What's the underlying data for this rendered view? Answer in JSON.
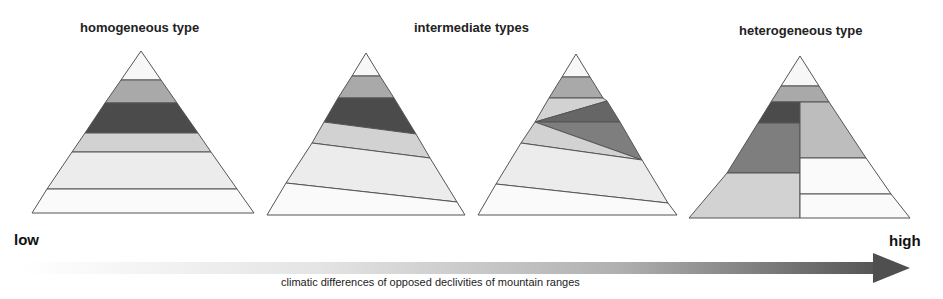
{
  "titles": {
    "homogeneous": "homogeneous type",
    "intermediate": "intermediate types",
    "heterogeneous": "heterogeneous type"
  },
  "axis": {
    "low_label": "low",
    "high_label": "high",
    "caption": "climatic differences of opposed declivities of mountain ranges"
  },
  "colors": {
    "white": "#f7f7f7",
    "very_light": "#ececec",
    "light_gray": "#d2d2d2",
    "mid_gray": "#a9a9a9",
    "mid_dark": "#7e7e7e",
    "dark": "#4b4b4b",
    "outline": "#555555"
  },
  "diagrams": [
    {
      "name": "homogeneous",
      "bands": [
        "white",
        "mid_gray",
        "dark",
        "light_gray",
        "very_light",
        "white"
      ]
    },
    {
      "name": "intermediate-1",
      "bands": [
        "white",
        "mid_gray",
        "dark",
        "light_gray",
        "very_light",
        "white"
      ]
    },
    {
      "name": "intermediate-2",
      "bands": [
        "white",
        "mid_gray",
        "light_gray",
        "dark",
        "mid_dark",
        "light_gray",
        "very_light",
        "white"
      ]
    },
    {
      "name": "heterogeneous",
      "left": [
        "dark",
        "mid_dark",
        "light_gray"
      ],
      "right": [
        "mid_gray",
        "white",
        "white"
      ]
    }
  ]
}
